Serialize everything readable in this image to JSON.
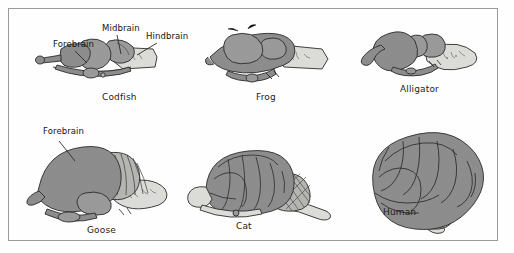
{
  "figure": {
    "background_color": "#ffffff",
    "frame_color": "#9a9a9a"
  },
  "palette": {
    "forebrain_fill": "#8d8d8d",
    "midbrain_fill": "#9a9a9a",
    "hindbrain_fill": "#dcdcd8",
    "cerebellum_fill": "#b5b5b2",
    "outline": "#2b2b2b",
    "text": "#1c1c1c"
  },
  "callouts": [
    {
      "id": "forebrain-top",
      "label": "Forebrain"
    },
    {
      "id": "midbrain-top",
      "label": "Midbrain"
    },
    {
      "id": "hindbrain-top",
      "label": "Hindbrain"
    },
    {
      "id": "forebrain-goose",
      "label": "Forebrain"
    }
  ],
  "specimens": [
    {
      "id": "codfish",
      "caption": "Codfish",
      "row": 1,
      "column": 1
    },
    {
      "id": "frog",
      "caption": "Frog",
      "row": 1,
      "column": 2
    },
    {
      "id": "alligator",
      "caption": "Alligator",
      "row": 1,
      "column": 3
    },
    {
      "id": "goose",
      "caption": "Goose",
      "row": 2,
      "column": 1
    },
    {
      "id": "cat",
      "caption": "Cat",
      "row": 2,
      "column": 2
    },
    {
      "id": "human",
      "caption": "Human",
      "row": 2,
      "column": 3
    }
  ]
}
